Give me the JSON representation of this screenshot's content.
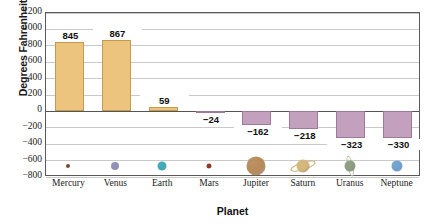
{
  "chart_data": {
    "type": "bar",
    "title": "",
    "xlabel": "Planet",
    "ylabel": "Degrees Fahrenheit",
    "categories": [
      "Mercury",
      "Venus",
      "Earth",
      "Mars",
      "Jupiter",
      "Saturn",
      "Uranus",
      "Neptune"
    ],
    "values": [
      845,
      867,
      59,
      -24,
      -162,
      -218,
      -323,
      -330
    ],
    "value_labels": [
      "845",
      "867",
      "59",
      "−24",
      "−162",
      "−218",
      "−323",
      "−330"
    ],
    "ylim": [
      -800,
      1200
    ],
    "ytick_labels": [
      "1200",
      "1000",
      "800",
      "600",
      "400",
      "200",
      "0",
      "−200",
      "−400",
      "−600",
      "−800"
    ],
    "ytick_values": [
      1200,
      1000,
      800,
      600,
      400,
      200,
      0,
      -200,
      -400,
      -600,
      -800
    ],
    "grid": true,
    "legend": "none",
    "positive_bar_color": "#ecc47e",
    "negative_bar_color": "#c3a0bd",
    "gridline_color": "#c9c9c9",
    "axis_color": "#5a5a5a"
  },
  "planet_icons": [
    {
      "name": "mercury-planet-icon",
      "color": "#6e4326",
      "size": 4,
      "ring": false
    },
    {
      "name": "venus-planet-icon",
      "color": "#8e8fb4",
      "size": 8,
      "ring": false
    },
    {
      "name": "earth-planet-icon",
      "color": "#3fa8b8",
      "size": 9,
      "ring": false
    },
    {
      "name": "mars-planet-icon",
      "color": "#8e3420",
      "size": 5,
      "ring": false
    },
    {
      "name": "jupiter-planet-icon",
      "color": "#b78a59",
      "size": 19,
      "ring": false
    },
    {
      "name": "saturn-planet-icon",
      "color": "#d3b579",
      "size": 13,
      "ring": true
    },
    {
      "name": "uranus-planet-icon",
      "color": "#8a9c7e",
      "size": 11,
      "ring": "vertical"
    },
    {
      "name": "neptune-planet-icon",
      "color": "#6ea0cf",
      "size": 11,
      "ring": false
    }
  ]
}
